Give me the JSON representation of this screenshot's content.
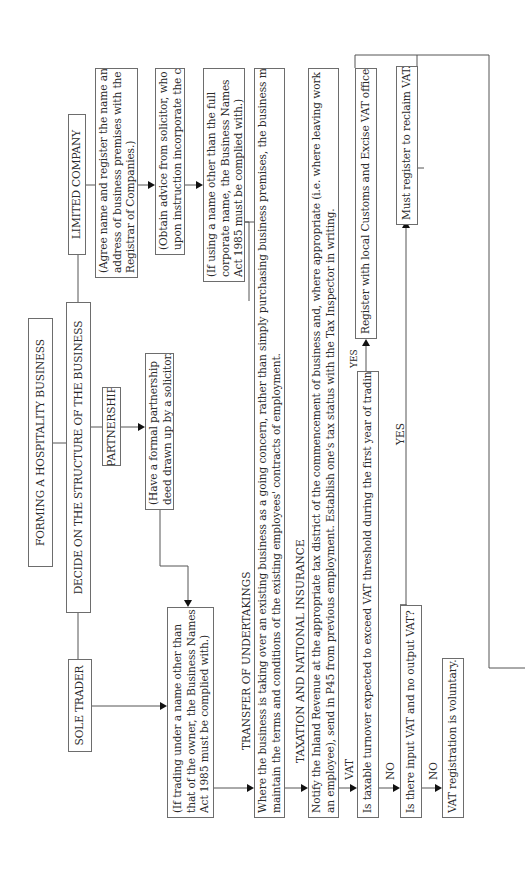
{
  "diagram": {
    "orientation": "rotated 90 degrees counter-clockwise",
    "title": "FORMING A HOSPITALITY BUSINESS",
    "decide": "DECIDE ON THE STRUCTURE OF THE BUSINESS",
    "structures": {
      "sole_trader": {
        "label": "SOLE TRADER",
        "note_lines": [
          "(If trading under a name other than",
          "that of the owner, the Business Names",
          "Act 1985 must be complied with.)"
        ]
      },
      "partnership": {
        "label": "PARTNERSHIP",
        "note_lines": [
          "(Have a formal partnership",
          "deed drawn up by a solicitor.)"
        ]
      },
      "limited_company": {
        "label": "LIMITED COMPANY",
        "step1_lines": [
          "(Agree name and register the name and",
          "address of business premises with the",
          "Registrar of Companies.)"
        ],
        "step2_lines": [
          "(Obtain advice from solicitor, who will",
          "upon instruction incorporate the company.)"
        ],
        "step3_lines": [
          "(If using a name other than the full",
          "corporate name, the Business Names",
          "Act 1985 must be complied with.)"
        ]
      }
    },
    "transfer": {
      "heading": "TRANSFER OF UNDERTAKINGS",
      "lines": [
        "Where the business is taking over an existing business as a going concern, rather than simply purchasing business premises, the business must",
        "maintain the terms and conditions of the existing employees' contracts of employment."
      ]
    },
    "taxation": {
      "heading": "TAXATION AND NATIONAL INSURANCE",
      "lines": [
        "Notify the Inland Revenue at the appropriate tax district of the commencement of business and, where appropriate (i.e. where leaving work as",
        "an employee), send in P45 from previous employment. Establish one's tax status with the Tax Inspector in writing."
      ]
    },
    "vat": {
      "heading": "VAT",
      "question1": "Is taxable turnover expected to exceed VAT threshold during the first year of trading?",
      "yes1": "YES",
      "register": "Register with local Customs and Excise VAT office.",
      "no1": "NO",
      "question2": "Is there input VAT and no output VAT?",
      "yes2": "YES",
      "must_register": "Must register to reclaim VAT.",
      "no2": "NO",
      "voluntary": "VAT registration is voluntary."
    }
  }
}
